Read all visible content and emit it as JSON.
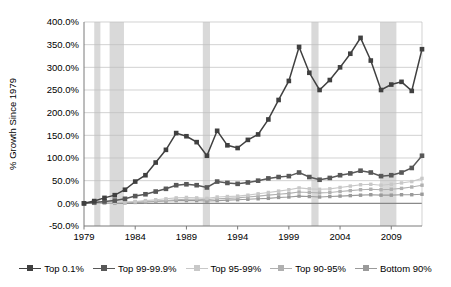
{
  "chart_data": {
    "type": "line",
    "title": "",
    "xlabel": "",
    "ylabel": "% Growth Since 1979",
    "x": [
      1979,
      1980,
      1981,
      1982,
      1983,
      1984,
      1985,
      1986,
      1987,
      1988,
      1989,
      1990,
      1991,
      1992,
      1993,
      1994,
      1995,
      1996,
      1997,
      1998,
      1999,
      2000,
      2001,
      2002,
      2003,
      2004,
      2005,
      2006,
      2007,
      2008,
      2009,
      2010,
      2011,
      2012
    ],
    "xlim": [
      1979,
      2012
    ],
    "ylim": [
      -50,
      400
    ],
    "ytick_labels": [
      "-50.0%",
      "0.0%",
      "50.0%",
      "100.0%",
      "150.0%",
      "200.0%",
      "250.0%",
      "300.0%",
      "350.0%",
      "400.0%"
    ],
    "ytick_values": [
      -50,
      0,
      50,
      100,
      150,
      200,
      250,
      300,
      350,
      400
    ],
    "xtick_values": [
      1979,
      1984,
      1989,
      1994,
      1999,
      2004,
      2009
    ],
    "xtick_labels": [
      "1979",
      "1984",
      "1989",
      "1994",
      "1999",
      "2004",
      "2009"
    ],
    "grid": "horizontal",
    "legend_position": "bottom",
    "series": [
      {
        "name": "Top 0.1%",
        "color": "#404040",
        "values": [
          0,
          5,
          12,
          18,
          30,
          48,
          62,
          90,
          118,
          155,
          148,
          135,
          105,
          160,
          128,
          122,
          140,
          152,
          185,
          228,
          270,
          345,
          288,
          250,
          272,
          300,
          330,
          365,
          315,
          250,
          262,
          268,
          248,
          340
        ]
      },
      {
        "name": "Top 99-99.9%",
        "color": "#585858",
        "values": [
          0,
          2,
          4,
          6,
          10,
          16,
          20,
          26,
          32,
          40,
          42,
          40,
          35,
          48,
          45,
          43,
          46,
          50,
          55,
          58,
          60,
          68,
          58,
          52,
          56,
          62,
          66,
          72,
          68,
          60,
          62,
          68,
          78,
          105
        ]
      },
      {
        "name": "Top 95-99%",
        "color": "#c8c8c8",
        "values": [
          0,
          1,
          1,
          2,
          3,
          4,
          6,
          8,
          10,
          12,
          13,
          12,
          11,
          14,
          15,
          16,
          18,
          21,
          24,
          27,
          30,
          34,
          32,
          31,
          32,
          35,
          38,
          41,
          42,
          40,
          42,
          45,
          48,
          55
        ]
      },
      {
        "name": "Top 90-95%",
        "color": "#b0b0b0",
        "values": [
          0,
          0,
          1,
          1,
          2,
          3,
          4,
          5,
          6,
          8,
          9,
          9,
          8,
          10,
          11,
          12,
          14,
          16,
          18,
          20,
          22,
          25,
          24,
          23,
          24,
          26,
          28,
          30,
          31,
          30,
          31,
          33,
          36,
          40
        ]
      },
      {
        "name": "Bottom 90%",
        "color": "#9a9a9a",
        "values": [
          0,
          0,
          0,
          0,
          1,
          2,
          3,
          4,
          5,
          6,
          6,
          6,
          5,
          6,
          7,
          8,
          9,
          10,
          11,
          13,
          14,
          16,
          15,
          14,
          15,
          16,
          17,
          18,
          19,
          18,
          18,
          19,
          19,
          20
        ]
      }
    ],
    "recession_bands": [
      {
        "start": 1980.0,
        "end": 1980.6
      },
      {
        "start": 1981.5,
        "end": 1982.9
      },
      {
        "start": 1990.6,
        "end": 1991.3
      },
      {
        "start": 2001.2,
        "end": 2001.9
      },
      {
        "start": 2007.9,
        "end": 2009.5
      }
    ],
    "recession_color": "#d9d9d9"
  }
}
